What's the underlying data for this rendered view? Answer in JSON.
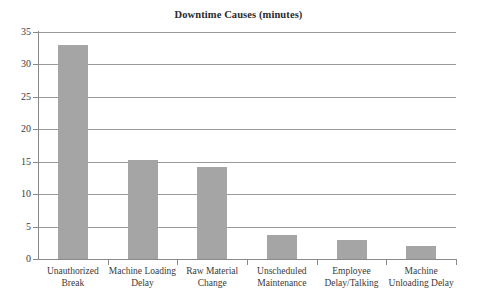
{
  "chart_data": {
    "type": "bar",
    "title": "Downtime Causes (minutes)",
    "xlabel": "",
    "ylabel": "",
    "ylim": [
      0,
      35
    ],
    "yticks": [
      0,
      5,
      10,
      15,
      20,
      25,
      30,
      35
    ],
    "grid": true,
    "legend": false,
    "bar_color": "#a5a5a5",
    "categories": [
      "Unauthorized Break",
      "Machine Loading Delay",
      "Raw Material Change",
      "Unscheduled Maintenance",
      "Employee Delay/Talking",
      "Machine Unloading Delay"
    ],
    "category_lines": [
      [
        "Unauthorized",
        "Break"
      ],
      [
        "Machine Loading",
        "Delay"
      ],
      [
        "Raw Material",
        "Change"
      ],
      [
        "Unscheduled",
        "Maintenance"
      ],
      [
        "Employee",
        "Delay/Talking"
      ],
      [
        "Machine",
        "Unloading Delay"
      ]
    ],
    "values": [
      33,
      15.3,
      14.2,
      3.7,
      3,
      2
    ]
  }
}
